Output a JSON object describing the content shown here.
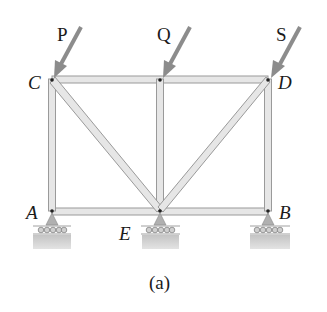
{
  "figure": {
    "caption": "(a)",
    "type": "truss",
    "nodes": [
      {
        "id": "C",
        "label": "C",
        "x": 52,
        "y": 79
      },
      {
        "id": "M",
        "label": "",
        "x": 160,
        "y": 79
      },
      {
        "id": "D",
        "label": "D",
        "x": 268,
        "y": 79
      },
      {
        "id": "A",
        "label": "A",
        "x": 52,
        "y": 211
      },
      {
        "id": "E",
        "label": "E",
        "x": 160,
        "y": 211
      },
      {
        "id": "B",
        "label": "B",
        "x": 268,
        "y": 211
      }
    ],
    "members": [
      [
        "C",
        "M"
      ],
      [
        "M",
        "D"
      ],
      [
        "A",
        "E"
      ],
      [
        "E",
        "B"
      ],
      [
        "C",
        "A"
      ],
      [
        "M",
        "E"
      ],
      [
        "D",
        "B"
      ],
      [
        "C",
        "E"
      ],
      [
        "D",
        "E"
      ]
    ],
    "loads": [
      {
        "label": "P",
        "at": "C"
      },
      {
        "label": "Q",
        "at": "M"
      },
      {
        "label": "S",
        "at": "D"
      }
    ],
    "supports": [
      {
        "at": "A",
        "type": "roller"
      },
      {
        "at": "E",
        "type": "roller"
      },
      {
        "at": "B",
        "type": "roller"
      }
    ],
    "colors": {
      "member_fill": "#e6e6e6",
      "member_edge": "#9a9a9a",
      "load_arrow": "#8c8c8c",
      "ground": "#b5b5b5",
      "pin": "#222222"
    }
  }
}
